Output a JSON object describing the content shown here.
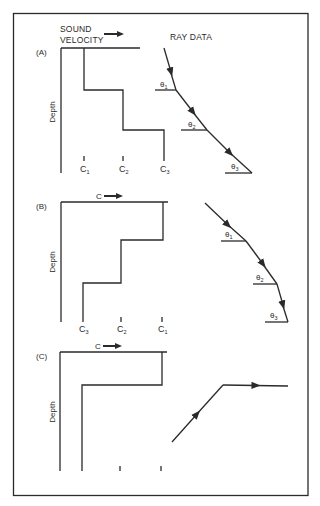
{
  "figure": {
    "header": {
      "sound_velocity_line1": "SOUND",
      "sound_velocity_line2": "VELOCITY",
      "ray_data": "RAY DATA"
    },
    "depth_label": "Depth",
    "panels": [
      {
        "id": "A",
        "label": "(A)",
        "velocity_labels": [
          {
            "letter": "C",
            "sub": "1"
          },
          {
            "letter": "C",
            "sub": "2"
          },
          {
            "letter": "C",
            "sub": "3"
          }
        ],
        "angle_labels": [
          {
            "letter": "θ",
            "sub": "1"
          },
          {
            "letter": "θ",
            "sub": "2"
          },
          {
            "letter": "θ",
            "sub": "3"
          }
        ],
        "description": "Sound velocity increases with depth in steps; ray bends away from vertical"
      },
      {
        "id": "B",
        "label": "(B)",
        "velocity_axis": "C",
        "velocity_labels": [
          {
            "letter": "C",
            "sub": "3"
          },
          {
            "letter": "C",
            "sub": "2"
          },
          {
            "letter": "C",
            "sub": "1"
          }
        ],
        "angle_labels": [
          {
            "letter": "θ",
            "sub": "1"
          },
          {
            "letter": "θ",
            "sub": "2"
          },
          {
            "letter": "θ",
            "sub": "3"
          }
        ],
        "description": "Sound velocity decreases with depth in steps; ray bends toward vertical"
      },
      {
        "id": "C",
        "label": "(C)",
        "velocity_axis": "C",
        "description": "Sharp velocity decrease; ray refracted to horizontal"
      }
    ]
  }
}
